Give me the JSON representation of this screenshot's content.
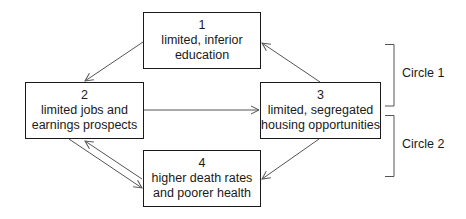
{
  "diagram": {
    "boxes": [
      {
        "id": 1,
        "number": "1",
        "lines": [
          "limited, inferior",
          "education"
        ]
      },
      {
        "id": 2,
        "number": "2",
        "lines": [
          "limited jobs and",
          "earnings prospects"
        ]
      },
      {
        "id": 3,
        "number": "3",
        "lines": [
          "limited, segregated",
          "housing opportunities"
        ]
      },
      {
        "id": 4,
        "number": "4",
        "lines": [
          "higher death rates",
          "and poorer health"
        ]
      }
    ],
    "arrows": [
      {
        "from": 1,
        "to": 2
      },
      {
        "from": 2,
        "to": 3
      },
      {
        "from": 3,
        "to": 1
      },
      {
        "from": 3,
        "to": 4
      },
      {
        "from": 2,
        "to": 4
      },
      {
        "from": 4,
        "to": 2
      }
    ],
    "brackets": [
      {
        "label": "Circle 1",
        "spans": "boxes 1 and 3 (upper loop)"
      },
      {
        "label": "Circle 2",
        "spans": "boxes 3 and 4 (lower loop)"
      }
    ],
    "colors": {
      "line": "#1a1a1a",
      "arrow": "#555555",
      "background": "#ffffff"
    }
  }
}
